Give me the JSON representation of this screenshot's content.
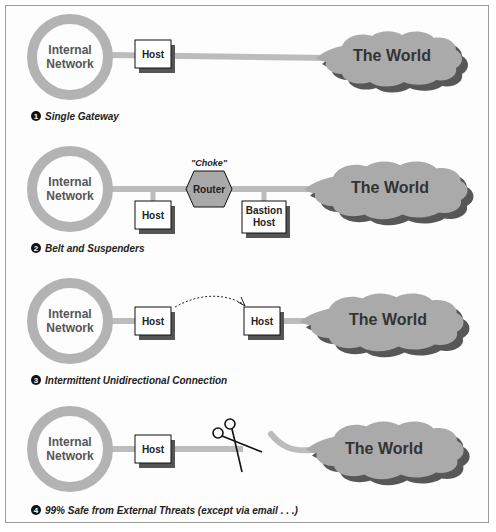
{
  "diagram": {
    "colors": {
      "ring": "#b3b3b3",
      "link": "#bcbcbc",
      "cloud": "#aaaaaa",
      "cloud_shadow": "#3a3a3a",
      "box_fill": "#ffffff",
      "box_border": "#111111",
      "router_fill": "#a9a9a9"
    },
    "panels": [
      {
        "number": "1",
        "caption": "Single Gateway",
        "network_line1": "Internal",
        "network_line2": "Network",
        "host": "Host",
        "world": "The World"
      },
      {
        "number": "2",
        "caption": "Belt and Suspenders",
        "network_line1": "Internal",
        "network_line2": "Network",
        "choke_label": "\"Choke\"",
        "router": "Router",
        "host": "Host",
        "bastion_line1": "Bastion",
        "bastion_line2": "Host",
        "world": "The World"
      },
      {
        "number": "3",
        "caption": "Intermittent Unidirectional Connection",
        "network_line1": "Internal",
        "network_line2": "Network",
        "host_left": "Host",
        "host_right": "Host",
        "world": "The World"
      },
      {
        "number": "4",
        "caption": "99% Safe from External Threats (except via email . . .)",
        "network_line1": "Internal",
        "network_line2": "Network",
        "host": "Host",
        "scissors_icon": "scissors-icon",
        "world": "The World"
      }
    ]
  }
}
